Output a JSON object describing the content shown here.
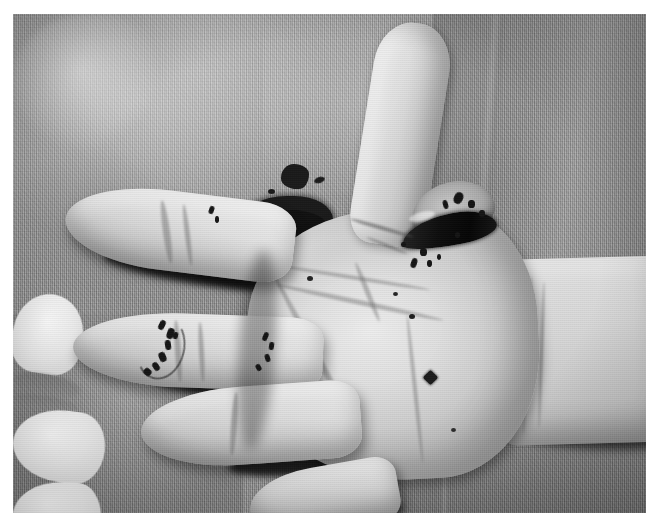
{
  "image": {
    "kind": "clinical-photograph",
    "subject": "hand",
    "view": "palmar",
    "color_mode": "grayscale",
    "width_px": 657,
    "height_px": 523,
    "border": {
      "color": "#ffffff",
      "top_px": 14,
      "left_px": 13,
      "right_px": 11,
      "bottom_px": 10
    },
    "caption": "",
    "alt_text": "Grayscale clinical photograph of an open palm resting on textured fabric, showing sutured finger wounds and a dark necrotic wound at the base of the thumb, with blood staining on the drape."
  },
  "background": {
    "name": "surgical drape",
    "material": "woven textured fabric",
    "tone_hex": "#a3a3a3",
    "shadow_hex": "#7e7e7e",
    "highlight_hex": "#c2c2c2",
    "folds": [
      "upper-left highlight",
      "right vertical fold",
      "lower-left seam",
      "lower-right horizontal fold"
    ]
  },
  "anatomy": {
    "hand_side": "palmar surface",
    "skin_hex": "#ded7cf",
    "shadow_hex": "#14130f",
    "parts": [
      {
        "id": "thumb",
        "label": "thumb",
        "note": "extended upward, interphalangeal crease visible"
      },
      {
        "id": "index",
        "label": "index finger",
        "note": "extended laterally, tip highlighted"
      },
      {
        "id": "middle",
        "label": "middle finger",
        "note": "sutured wound across distal pad"
      },
      {
        "id": "ring",
        "label": "ring finger",
        "note": "flexed, suture marks on mid phalanx"
      },
      {
        "id": "little",
        "label": "little finger",
        "note": "partially cropped at lower border"
      },
      {
        "id": "palm",
        "label": "palm",
        "note": "thenar and hypothenar eminences, palmar creases"
      },
      {
        "id": "wrist",
        "label": "wrist / distal forearm",
        "note": "transverse flexion creases"
      }
    ]
  },
  "findings": [
    {
      "id": "thumb-base-wound",
      "label": "thumb base wound",
      "description": "dark necrotic / eschar lesion with adjacent raised skin flap and suture points",
      "tone_hex": "#0d0c0a"
    },
    {
      "id": "middle-finger-sutures",
      "label": "middle finger sutures",
      "description": "arc of dark suture knots along the distal pulp"
    },
    {
      "id": "ring-finger-sutures",
      "label": "ring finger sutures",
      "description": "short row of dark suture knots on the mid phalanx"
    },
    {
      "id": "palm-puncture",
      "label": "palm puncture mark",
      "description": "small dark diamond-shaped puncture on the hypothenar palm",
      "tone_hex": "#201d19"
    },
    {
      "id": "drape-blood-stain",
      "label": "blood staining on drape",
      "description": "two dark irregular blood stains with satellite flecks on the fabric above the palm",
      "tone_hex": "#1d1c1b"
    }
  ]
}
